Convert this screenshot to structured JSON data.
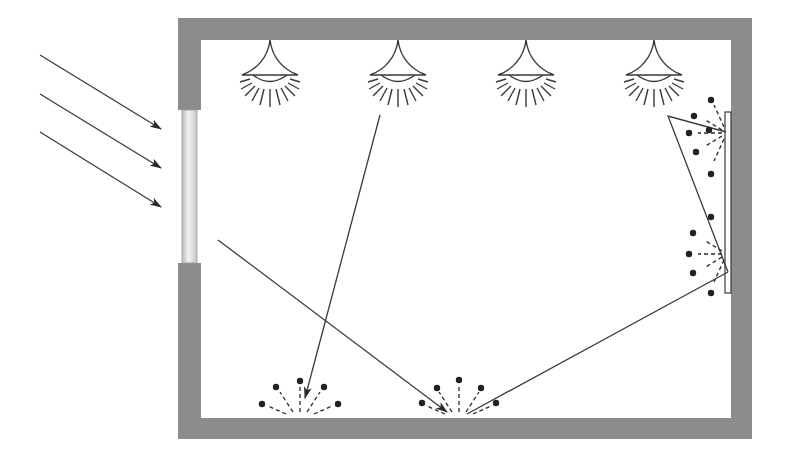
{
  "diagram": {
    "title": "Room lighting: daylight, artificial lighting and reflections",
    "colors": {
      "wall": "#8c8c8c",
      "background": "#ffffff",
      "line": "#3a3a3a",
      "window_glass": "#d9d9d9"
    },
    "room": {
      "outer": [
        178,
        18,
        752,
        439
      ],
      "inner": [
        201,
        40,
        731,
        418
      ]
    },
    "window": {
      "x": 182,
      "y1": 110,
      "y2": 263
    },
    "sun_rays": [
      {
        "from": [
          40,
          55
        ],
        "to": [
          161,
          129
        ]
      },
      {
        "from": [
          40,
          94
        ],
        "to": [
          161,
          168
        ]
      },
      {
        "from": [
          40,
          132
        ],
        "to": [
          161,
          207
        ]
      }
    ],
    "lamps": [
      {
        "name": "ceiling-lamp-1",
        "x": 270
      },
      {
        "name": "ceiling-lamp-2",
        "x": 398
      },
      {
        "name": "ceiling-lamp-3",
        "x": 526
      },
      {
        "name": "ceiling-lamp-4",
        "x": 654
      }
    ],
    "light_paths": [
      {
        "name": "lamp-ray-to-floor",
        "points": [
          [
            380,
            115
          ],
          [
            305,
            398
          ]
        ]
      },
      {
        "name": "daylight-ray-to-floor",
        "points": [
          [
            218,
            240
          ],
          [
            447,
            412
          ]
        ]
      },
      {
        "name": "floor-reflection-to-wall",
        "points": [
          [
            467,
            414
          ],
          [
            728,
            272
          ]
        ]
      },
      {
        "name": "wall-reflection-up",
        "points": [
          [
            728,
            272
          ],
          [
            668,
            116
          ],
          [
            726,
            132
          ]
        ]
      }
    ],
    "wall_panel": {
      "x": 725,
      "y1": 112,
      "y2": 293
    },
    "diffuse_reflections": [
      {
        "name": "floor-scatter-1",
        "cx": 300,
        "cy": 416,
        "direction": "up"
      },
      {
        "name": "floor-scatter-2",
        "cx": 459,
        "cy": 416,
        "direction": "up"
      },
      {
        "name": "wall-scatter-1",
        "cx": 727,
        "cy": 133,
        "direction": "left"
      },
      {
        "name": "wall-scatter-2",
        "cx": 727,
        "cy": 254,
        "direction": "left"
      }
    ]
  }
}
